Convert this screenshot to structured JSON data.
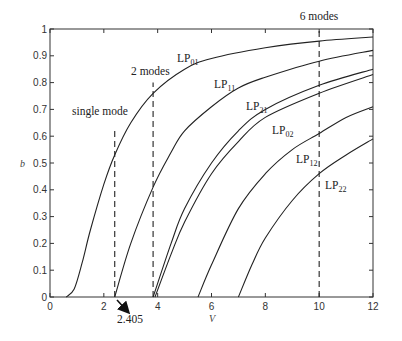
{
  "chart_data": {
    "type": "line",
    "title": "",
    "xlabel": "V",
    "ylabel": "b",
    "xlim": [
      0,
      12
    ],
    "ylim": [
      0,
      1
    ],
    "xticks": [
      0,
      2,
      4,
      6,
      8,
      10,
      12
    ],
    "yticks": [
      0,
      0.1,
      0.2,
      0.3,
      0.4,
      0.5,
      0.6,
      0.7,
      0.8,
      0.9,
      1
    ],
    "xtick_labels": [
      "0",
      "2",
      "4",
      "6",
      "8",
      "10",
      "12"
    ],
    "ytick_labels": [
      "0",
      "0.1",
      "0.2",
      "0.3",
      "0.4",
      "0.5",
      "0.6",
      "0.7",
      "0.8",
      "0.9",
      "1"
    ],
    "grid": false,
    "series": [
      {
        "name": "LP01",
        "label_main": "LP",
        "label_sub": "01",
        "x": [
          0.6,
          0.9,
          1.2,
          1.5,
          2.0,
          2.405,
          3.0,
          3.83,
          5.0,
          6.0,
          8.0,
          10.0,
          12.0
        ],
        "y": [
          0.0,
          0.03,
          0.13,
          0.25,
          0.42,
          0.53,
          0.65,
          0.76,
          0.85,
          0.89,
          0.93,
          0.955,
          0.97
        ]
      },
      {
        "name": "LP11",
        "label_main": "LP",
        "label_sub": "11",
        "x": [
          2.405,
          3.0,
          3.83,
          4.5,
          5.0,
          6.0,
          7.0,
          8.0,
          10.0,
          12.0
        ],
        "y": [
          0.0,
          0.2,
          0.41,
          0.54,
          0.62,
          0.71,
          0.78,
          0.82,
          0.88,
          0.92
        ]
      },
      {
        "name": "LP21",
        "label_main": "LP",
        "label_sub": "21",
        "x": [
          3.83,
          4.5,
          5.0,
          6.0,
          7.0,
          8.0,
          10.0,
          12.0
        ],
        "y": [
          0.0,
          0.2,
          0.33,
          0.5,
          0.62,
          0.7,
          0.79,
          0.85
        ]
      },
      {
        "name": "LP02",
        "label_main": "LP",
        "label_sub": "02",
        "x": [
          3.9,
          4.5,
          5.0,
          6.0,
          7.0,
          8.0,
          10.0,
          12.0
        ],
        "y": [
          0.0,
          0.16,
          0.28,
          0.46,
          0.58,
          0.67,
          0.76,
          0.83
        ]
      },
      {
        "name": "LP12",
        "label_main": "LP",
        "label_sub": "12",
        "x": [
          5.5,
          6.0,
          7.0,
          8.0,
          9.0,
          10.0,
          11.0,
          12.0
        ],
        "y": [
          0.0,
          0.12,
          0.33,
          0.46,
          0.55,
          0.61,
          0.67,
          0.71
        ]
      },
      {
        "name": "LP22",
        "label_main": "LP",
        "label_sub": "22",
        "x": [
          7.0,
          7.5,
          8.0,
          9.0,
          10.0,
          11.0,
          12.0
        ],
        "y": [
          0.0,
          0.12,
          0.22,
          0.36,
          0.46,
          0.53,
          0.59
        ]
      }
    ],
    "vlines": [
      {
        "x": 2.405,
        "label": "single mode",
        "y_top": 0.62
      },
      {
        "x": 3.83,
        "label": "2 modes",
        "y_top": 0.8
      },
      {
        "x": 10.0,
        "label": "6 modes",
        "y_top": 1.0
      }
    ],
    "annotations": [
      {
        "text": "2.405",
        "arrow_to_x": 2.405,
        "arrow_to_y": 0
      }
    ]
  }
}
